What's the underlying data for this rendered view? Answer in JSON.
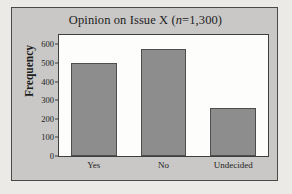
{
  "chart_data": {
    "type": "bar",
    "title": "Opinion on Issue X (n=1,300)",
    "title_prefix": "Opinion on Issue X (",
    "title_italic": "n",
    "title_suffix": "=1,300)",
    "xlabel": "",
    "ylabel": "Frequency",
    "categories": [
      "Yes",
      "No",
      "Undecided"
    ],
    "values": [
      500,
      575,
      257
    ],
    "ylim": [
      0,
      650
    ],
    "yticks": [
      0,
      100,
      200,
      300,
      400,
      500,
      600
    ],
    "ytick_labels": [
      "0",
      "100",
      "200",
      "300",
      "400",
      "500",
      "600"
    ],
    "grid": false,
    "legend": false,
    "bar_color": "#8d8d8d",
    "bar_edge_color": "#4e4e4e",
    "panel_color": "#c9c8c6",
    "plot_bg_color": "#fdfdfc",
    "axis_color": "#3f3f3f",
    "text_color": "#1d1d1d"
  }
}
